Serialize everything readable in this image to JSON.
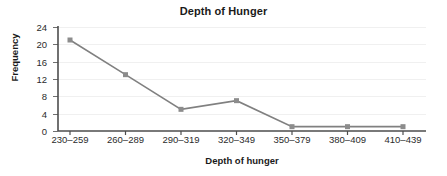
{
  "chart_data": {
    "type": "line",
    "title": "Depth of Hunger",
    "xlabel": "Depth of hunger",
    "ylabel": "Frequency",
    "categories": [
      "230–259",
      "260–289",
      "290–319",
      "320–349",
      "350–379",
      "380–409",
      "410–439"
    ],
    "values": [
      21,
      13,
      5,
      7,
      1,
      1,
      1
    ],
    "series": [
      {
        "name": "Frequency",
        "values": [
          21,
          13,
          5,
          7,
          1,
          1,
          1
        ]
      }
    ],
    "ylim": [
      0,
      24
    ],
    "ytick_labels": [
      "0",
      "4",
      "8",
      "12",
      "16",
      "20",
      "24"
    ],
    "yticks": [
      0,
      4,
      8,
      12,
      16,
      20,
      24
    ],
    "grid": true,
    "grid_axis": "y",
    "legend": false,
    "legend_position": "none",
    "marker": "square",
    "colors": {
      "line": "#808080",
      "marker": "#8c8c8c",
      "axis": "#4d4d4d",
      "grid": "#f0f0f0",
      "text": "#1a1a1a",
      "tick_text": "#2b2b2b",
      "background": "#ffffff"
    }
  }
}
